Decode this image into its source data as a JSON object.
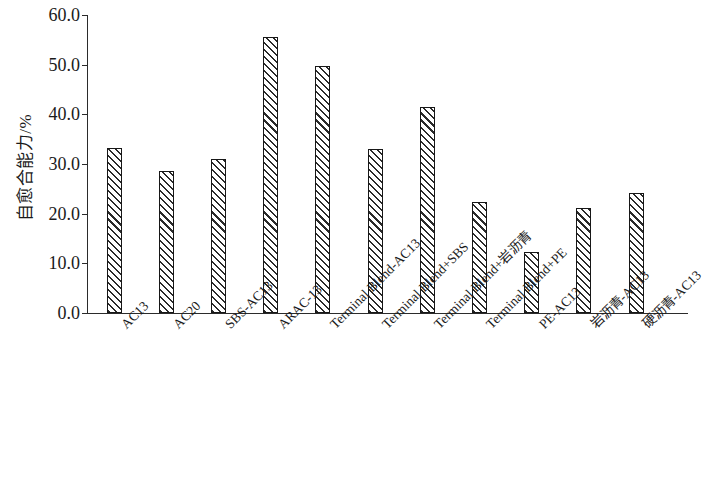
{
  "chart_data": {
    "type": "bar",
    "title": "",
    "subtitle": "",
    "xlabel": "",
    "ylabel": "自愈合能力/%",
    "ylim": [
      0.0,
      60.0
    ],
    "ytick_values": [
      0.0,
      10.0,
      20.0,
      30.0,
      40.0,
      50.0,
      60.0
    ],
    "ytick_labels": [
      "0.0",
      "10.0",
      "20.0",
      "30.0",
      "40.0",
      "50.0",
      "60.0"
    ],
    "grid": false,
    "legend": null,
    "bar_style": {
      "fill": "diagonal-hatch",
      "hatch_color": "#2a2a2a",
      "face_color": "#ffffff",
      "edge_color": "#171717"
    },
    "categories": [
      "AC13",
      "AC20",
      "SBS-AC13",
      "ARAC-13",
      "Terminal Blend-AC13",
      "Terminal Blend+SBS",
      "Terminal Blend+岩沥青",
      "Terminal Blend+PE",
      "PE-AC13",
      "岩沥青-AC13",
      "硬沥青-AC13"
    ],
    "values": [
      33.2,
      28.5,
      31.1,
      55.6,
      49.7,
      33.0,
      41.5,
      22.3,
      12.3,
      21.2,
      24.2
    ]
  }
}
